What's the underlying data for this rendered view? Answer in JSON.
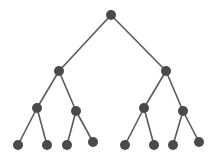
{
  "diagram": {
    "type": "binary-tree",
    "depth": 4,
    "colors": {
      "node": "#4a4a4a",
      "edge": "#5a5a5a",
      "background": "#ffffff"
    },
    "node_radius": 5,
    "nodes": [
      {
        "id": "n0",
        "x": 111,
        "y": 15,
        "level": 0
      },
      {
        "id": "n1",
        "x": 59,
        "y": 71,
        "level": 1
      },
      {
        "id": "n2",
        "x": 166,
        "y": 71,
        "level": 1
      },
      {
        "id": "n3",
        "x": 37,
        "y": 108,
        "level": 2
      },
      {
        "id": "n4",
        "x": 76,
        "y": 111,
        "level": 2
      },
      {
        "id": "n5",
        "x": 144,
        "y": 108,
        "level": 2
      },
      {
        "id": "n6",
        "x": 183,
        "y": 111,
        "level": 2
      },
      {
        "id": "n7",
        "x": 18,
        "y": 145,
        "level": 3
      },
      {
        "id": "n8",
        "x": 47,
        "y": 145,
        "level": 3
      },
      {
        "id": "n9",
        "x": 67,
        "y": 145,
        "level": 3
      },
      {
        "id": "n10",
        "x": 93,
        "y": 142,
        "level": 3
      },
      {
        "id": "n11",
        "x": 125,
        "y": 145,
        "level": 3
      },
      {
        "id": "n12",
        "x": 154,
        "y": 145,
        "level": 3
      },
      {
        "id": "n13",
        "x": 173,
        "y": 145,
        "level": 3
      },
      {
        "id": "n14",
        "x": 199,
        "y": 142,
        "level": 3
      }
    ],
    "edges": [
      [
        "n0",
        "n1"
      ],
      [
        "n0",
        "n2"
      ],
      [
        "n1",
        "n3"
      ],
      [
        "n1",
        "n4"
      ],
      [
        "n2",
        "n5"
      ],
      [
        "n2",
        "n6"
      ],
      [
        "n3",
        "n7"
      ],
      [
        "n3",
        "n8"
      ],
      [
        "n4",
        "n9"
      ],
      [
        "n4",
        "n10"
      ],
      [
        "n5",
        "n11"
      ],
      [
        "n5",
        "n12"
      ],
      [
        "n6",
        "n13"
      ],
      [
        "n6",
        "n14"
      ]
    ]
  }
}
